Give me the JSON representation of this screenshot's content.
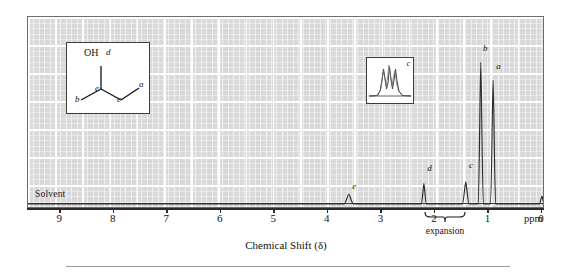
{
  "figure": {
    "axis_title": "Chemical Shift (δ)",
    "ppm_unit": "ppm",
    "solvent_label": "Solvent",
    "expansion_word": "expansion"
  },
  "axis": {
    "ticks": [
      "9",
      "8",
      "7",
      "6",
      "5",
      "4",
      "3",
      "2",
      "1",
      "0"
    ],
    "min_ppm": 0,
    "max_ppm": 9.6,
    "direction": "right-to-left"
  },
  "structure": {
    "title": "2-butanol",
    "oh_label": "OH",
    "labels": {
      "d": "d",
      "e": "e",
      "b": "b",
      "c": "c",
      "a": "a"
    }
  },
  "expansion_inset": {
    "label": "c",
    "description": "multiplet expansion of peak c"
  },
  "peaks": [
    {
      "id": "e",
      "label": "e",
      "ppm": 3.62,
      "height": 0.055,
      "width": 0.055,
      "label_dx": 4,
      "label_dy": -12
    },
    {
      "id": "d",
      "label": "d",
      "ppm": 2.22,
      "height": 0.115,
      "width": 0.03,
      "label_dx": 4,
      "label_dy": -20
    },
    {
      "id": "c",
      "label": "c",
      "ppm": 1.44,
      "height": 0.125,
      "width": 0.04,
      "label_dx": 4,
      "label_dy": -21
    },
    {
      "id": "b",
      "label": "b",
      "ppm": 1.16,
      "height": 0.8,
      "width": 0.022,
      "label_dx": 3,
      "label_dy": -19
    },
    {
      "id": "a",
      "label": "a",
      "ppm": 0.93,
      "height": 0.7,
      "width": 0.02,
      "label_dx": 4,
      "label_dy": -19
    },
    {
      "id": "tms",
      "label": "",
      "ppm": 0.02,
      "height": 0.045,
      "width": 0.022,
      "label_dx": 0,
      "label_dy": 0
    }
  ],
  "colors": {
    "plot_background": "#d9d9d9",
    "grid": "#ffffff",
    "trace": "#2b2b2b",
    "frame": "#6e6e6e",
    "text": "#111111",
    "page": "#ffffff"
  },
  "chart_data": {
    "type": "line",
    "title": "",
    "xlabel": "Chemical Shift (δ)",
    "ylabel": "",
    "xlim": [
      9.6,
      0
    ],
    "grid": true,
    "legend": "none",
    "x_tick_labels": [
      "9",
      "8",
      "7",
      "6",
      "5",
      "4",
      "3",
      "2",
      "1",
      "0"
    ],
    "annotations": [
      "Solvent",
      "expansion",
      "ppm"
    ],
    "series": [
      {
        "name": "1H NMR spectrum of 2-butanol",
        "peaks_ppm": [
          3.62,
          2.22,
          1.44,
          1.16,
          0.93,
          0.02
        ],
        "peak_labels": [
          "e",
          "d",
          "c",
          "b",
          "a",
          "TMS"
        ],
        "relative_intensities": [
          0.055,
          0.115,
          0.125,
          0.8,
          0.7,
          0.045
        ]
      }
    ]
  }
}
